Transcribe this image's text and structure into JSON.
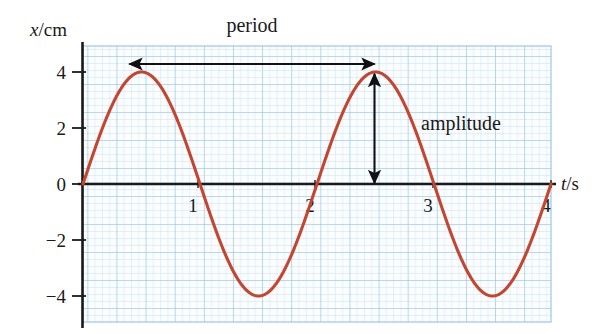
{
  "figure": {
    "background_color": "#ffffff",
    "plot_background_color": "#fbfdff",
    "minor_grid_color": "#bcdcf2",
    "major_grid_color": "#8fc4e8",
    "axis_color": "#1a1a1a",
    "curve_color": "#c5462f",
    "annotation_color": "#111111"
  },
  "chart_data": {
    "type": "line",
    "title": "",
    "subtitle": "",
    "xlabel": "t/s",
    "ylabel": "x/cm",
    "xlabel_parts": {
      "symbol": "t",
      "unit": "/s"
    },
    "ylabel_parts": {
      "symbol": "x",
      "unit": "/cm"
    },
    "xlim": [
      0,
      4
    ],
    "ylim": [
      -4.6,
      4.6
    ],
    "xticks": [
      1,
      2,
      3,
      4
    ],
    "xtick_labels": [
      "1",
      "2",
      "3",
      "4"
    ],
    "yticks": [
      4,
      2,
      0,
      -2,
      -4
    ],
    "ytick_labels": [
      "4",
      "2",
      "0",
      "−2",
      "−4"
    ],
    "grid": true,
    "grid_minor_step_x": 0.0625,
    "grid_minor_step_y": 0.25,
    "grid_major_step_x": 0.25,
    "grid_major_step_y": 1,
    "legend": false,
    "legend_position": "none",
    "series": [
      {
        "name": "displacement",
        "color": "#c5462f",
        "equation": "x = 4 sin(pi t)",
        "amplitude": 4,
        "period": 2,
        "x": [
          0,
          0.1,
          0.2,
          0.3,
          0.4,
          0.5,
          0.6,
          0.7,
          0.8,
          0.9,
          1.0,
          1.1,
          1.2,
          1.3,
          1.4,
          1.5,
          1.6,
          1.7,
          1.8,
          1.9,
          2.0,
          2.1,
          2.2,
          2.3,
          2.4,
          2.5,
          2.6,
          2.7,
          2.8,
          2.9,
          3.0,
          3.1,
          3.2,
          3.3,
          3.4,
          3.5,
          3.6,
          3.7,
          3.8,
          3.9,
          4.0
        ],
        "values": [
          0,
          1.236,
          2.351,
          3.236,
          3.804,
          4.0,
          3.804,
          3.236,
          2.351,
          1.236,
          0,
          -1.236,
          -2.351,
          -3.236,
          -3.804,
          -4.0,
          -3.804,
          -3.236,
          -2.351,
          -1.236,
          0,
          1.236,
          2.351,
          3.236,
          3.804,
          4.0,
          3.804,
          3.236,
          2.351,
          1.236,
          0,
          -1.236,
          -2.351,
          -3.236,
          -3.804,
          -4.0,
          -3.804,
          -3.236,
          -2.351,
          -1.236,
          0
        ]
      }
    ],
    "annotations": [
      {
        "id": "period",
        "label": "period",
        "type": "double-arrow-horizontal",
        "from": {
          "t": 0.5,
          "x": 4
        },
        "to": {
          "t": 2.5,
          "x": 4
        },
        "value": 2,
        "unit": "s"
      },
      {
        "id": "amplitude",
        "label": "amplitude",
        "type": "double-arrow-vertical",
        "from": {
          "t": 2.5,
          "x": 4
        },
        "to": {
          "t": 2.5,
          "x": 0
        },
        "value": 4,
        "unit": "cm"
      }
    ]
  },
  "labels": {
    "period": "period",
    "amplitude": "amplitude",
    "y_axis_symbol": "x",
    "y_axis_unit": "/cm",
    "x_axis_symbol": "t",
    "x_axis_unit": "/s"
  }
}
